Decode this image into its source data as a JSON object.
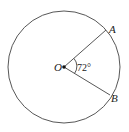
{
  "diagram": {
    "center_label": "O",
    "point_a_label": "A",
    "point_b_label": "B",
    "angle_label": "72°",
    "angle_degrees": 72,
    "colors": {
      "stroke": "#444444",
      "background": "#ffffff"
    }
  }
}
